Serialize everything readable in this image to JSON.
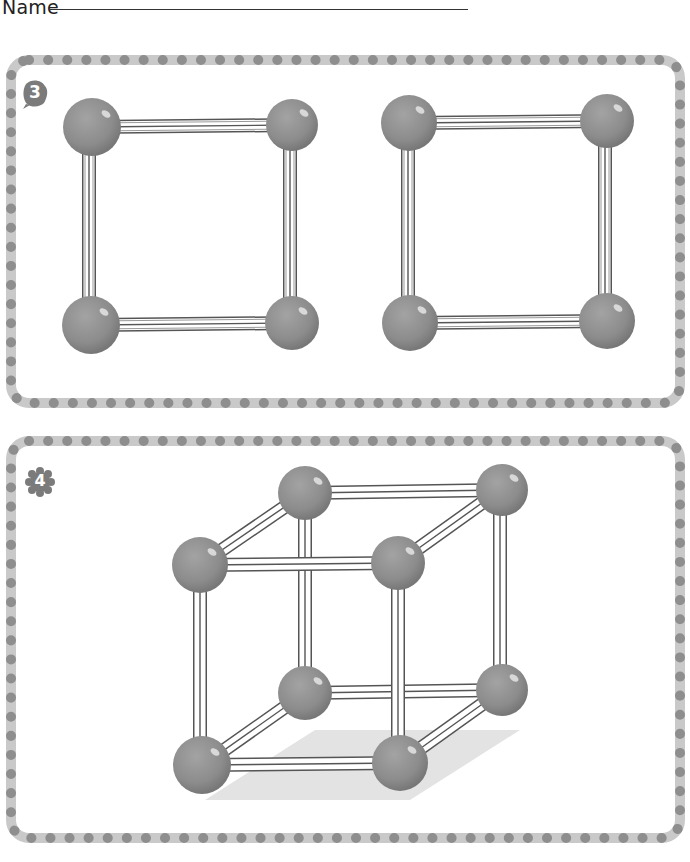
{
  "header": {
    "name_label": "Name"
  },
  "colors": {
    "border_track": "#c9c9c9",
    "border_dot": "#8e8e8e",
    "sphere": "#8f8f8f",
    "sphere_dark": "#7a7a7a",
    "sphere_highlight": "#dcdcdc",
    "rod_light": "#ffffff",
    "rod_dark": "#555555",
    "shadow": "#e2e2e2"
  },
  "panels": [
    {
      "id": "problem-3",
      "number": "3",
      "description": "Two separate squares made of four spheres connected by rods",
      "shapes": [
        "square",
        "square"
      ]
    },
    {
      "id": "problem-4",
      "number": "4",
      "description": "Cube made of eight spheres connected by twelve rods",
      "shapes": [
        "cube"
      ]
    }
  ]
}
